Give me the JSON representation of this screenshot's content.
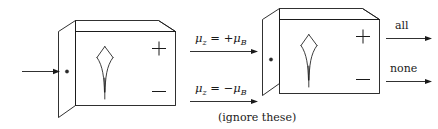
{
  "figure": {
    "name": "sequential-stern-gerlach-apparatus",
    "background_color": "#ffffff",
    "ink_color": "#1a1a1a",
    "width": 438,
    "height": 129
  },
  "input_beam": {
    "arrow_name": "incoming-beam-arrow",
    "label": ""
  },
  "apparatus_1": {
    "name": "first-stern-gerlach-box",
    "entry_port_marker": "o",
    "plus_label": "+",
    "minus_label": "−",
    "beam_symbol": "splitting-beam"
  },
  "apparatus_2": {
    "name": "second-stern-gerlach-box",
    "entry_port_marker": "o",
    "plus_label": "+",
    "minus_label": "−",
    "beam_symbol": "splitting-beam"
  },
  "middle_labels": {
    "upper": {
      "mu": "μ",
      "mu_sub": "z",
      "equals": " = +",
      "mu2": "μ",
      "mu2_sub": "B",
      "full_text": "μ₂ = +μᴮ"
    },
    "lower": {
      "mu": "μ",
      "mu_sub": "z",
      "equals": " = −",
      "mu2": "μ",
      "mu2_sub": "B",
      "full_text": "μ₂ = −μᴮ"
    },
    "note": "(ignore these)"
  },
  "output_labels": {
    "upper": "all",
    "lower": "none"
  }
}
